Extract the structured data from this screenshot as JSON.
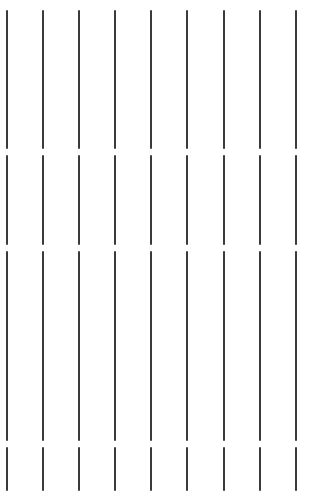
{
  "canvas": {
    "width": 316,
    "height": 494,
    "background": "#ffffff",
    "line_color": "#3a3a3a",
    "line_width": 2
  },
  "lines": {
    "x_positions": [
      7,
      43,
      79,
      115,
      151,
      187,
      224,
      260,
      296
    ],
    "segments": [
      {
        "top": 10,
        "bottom": 149
      },
      {
        "top": 155,
        "bottom": 245
      },
      {
        "top": 251,
        "bottom": 441
      },
      {
        "top": 447,
        "bottom": 491
      }
    ]
  }
}
